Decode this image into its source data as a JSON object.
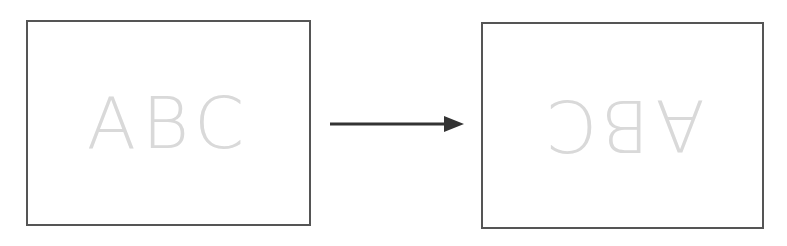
{
  "diagram": {
    "source": {
      "text": "ABC",
      "rotation_deg": 0
    },
    "result": {
      "text": "ABC",
      "rotation_deg": 180
    },
    "arrow": {
      "direction": "right"
    },
    "colors": {
      "border": "#555555",
      "text": "#d9d9d9",
      "arrow": "#333333"
    }
  }
}
